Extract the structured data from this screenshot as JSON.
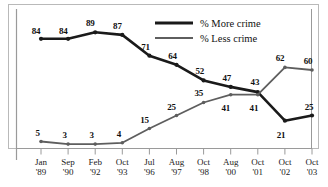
{
  "chart_data": {
    "type": "line",
    "title": "",
    "subtitle": "",
    "xlabel": "",
    "ylabel": "",
    "ylim": [
      0,
      100
    ],
    "grid": false,
    "legend_position": "top-right",
    "categories": [
      "Jan '89",
      "Sep '90",
      "Feb '92",
      "Oct '93",
      "Jul '96",
      "Aug '97",
      "Oct '98",
      "Aug '00",
      "Oct '01",
      "Oct '02",
      "Oct '03"
    ],
    "x_tick_month": [
      "Jan",
      "Sep",
      "Feb",
      "Oct",
      "Jul",
      "Aug",
      "Oct",
      "Aug",
      "Oct",
      "Oct",
      "Oct"
    ],
    "x_tick_year": [
      "'89",
      "'90",
      "'92",
      "'93",
      "'96",
      "'97",
      "'98",
      "'00",
      "'01",
      "'02",
      "'03"
    ],
    "series": [
      {
        "name": "% More crime",
        "color": "#1a1a1a",
        "width": 2.6,
        "values": [
          84,
          84,
          89,
          87,
          71,
          64,
          52,
          47,
          43,
          21,
          25
        ],
        "labels": [
          "84",
          "84",
          "89",
          "87",
          "71",
          "64",
          "52",
          "47",
          "43",
          "21",
          "25"
        ]
      },
      {
        "name": "% Less crime",
        "color": "#5e5e5e",
        "width": 1.8,
        "values": [
          5,
          3,
          3,
          4,
          15,
          25,
          35,
          41,
          41,
          62,
          60
        ],
        "labels": [
          "5",
          "3",
          "3",
          "4",
          "15",
          "25",
          "35",
          "41",
          "41",
          "62",
          "60"
        ]
      }
    ]
  },
  "legend": {
    "items": [
      {
        "label": "% More crime",
        "color": "#1a1a1a"
      },
      {
        "label": "% Less crime",
        "color": "#5e5e5e"
      }
    ]
  },
  "axis": {
    "axis_color": "#9a9a9a",
    "frame_color": "#b9b9b9"
  }
}
